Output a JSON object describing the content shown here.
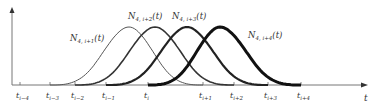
{
  "diagram": {
    "axis": {
      "x_label": "t",
      "baseline_y": 85,
      "y_axis_x": 12,
      "color": "#777777"
    },
    "knots": [
      {
        "label": "t_{i-4}",
        "base": "t",
        "sub": "i−4",
        "x": 20
      },
      {
        "label": "t_{i-3}",
        "base": "t",
        "sub": "i−3",
        "x": 50
      },
      {
        "label": "t_{i-2}",
        "base": "t",
        "sub": "i−2",
        "x": 75
      },
      {
        "label": "t_{i-1}",
        "base": "t",
        "sub": "i−1",
        "x": 106
      },
      {
        "label": "t_i",
        "base": "t",
        "sub": "i",
        "x": 148
      },
      {
        "label": "t_{i+1}",
        "base": "t",
        "sub": "i+1",
        "x": 203
      },
      {
        "label": "t_{i+2}",
        "base": "t",
        "sub": "i+2",
        "x": 234
      },
      {
        "label": "t_{i+3}",
        "base": "t",
        "sub": "i+3",
        "x": 268
      },
      {
        "label": "t_{i+4}",
        "base": "t",
        "sub": "i+4",
        "x": 301
      }
    ],
    "curves": [
      {
        "name": "N_{4,i+1}(t)",
        "base": "N",
        "sub": "4, i+1",
        "arg": "(t)",
        "start": 50,
        "peak": 129,
        "end": 203,
        "stroke": 1.0,
        "color": "#555555",
        "label_x": 70,
        "label_y": 41
      },
      {
        "name": "N_{4,i+2}(t)",
        "base": "N",
        "sub": "4, i+2",
        "arg": "(t)",
        "start": 75,
        "peak": 155,
        "end": 234,
        "stroke": 1.6,
        "color": "#333333",
        "label_x": 128,
        "label_y": 19
      },
      {
        "name": "N_{4,i+3}(t)",
        "base": "N",
        "sub": "4, i+3",
        "arg": "(t)",
        "start": 106,
        "peak": 187,
        "end": 268,
        "stroke": 2.2,
        "color": "#222222",
        "label_x": 172,
        "label_y": 19
      },
      {
        "name": "N_{4,i+4}(t)",
        "base": "N",
        "sub": "4, i+4",
        "arg": "(t)",
        "start": 148,
        "peak": 220,
        "end": 301,
        "stroke": 3.0,
        "color": "#111111",
        "label_x": 248,
        "label_y": 38
      }
    ],
    "peak_y": 27
  }
}
